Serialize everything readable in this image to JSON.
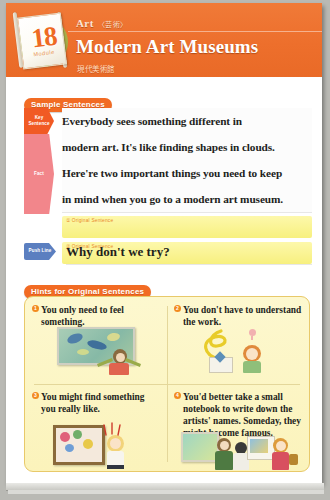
{
  "header": {
    "unit_number": "18",
    "unit_word": "Module",
    "kicker": "Art",
    "kicker_jp": "〈芸術〉",
    "title": "Modern Art Museums",
    "title_jp": "現代美術館",
    "accent_color": "#ef7633",
    "badge_disc_color": "#a8b84e"
  },
  "sample_section": {
    "tag": "Sample Sentences",
    "marks": {
      "key": "Key Sentence",
      "fact": "Fact",
      "push": "Push Line"
    },
    "lines": [
      "Everybody sees something different in",
      "modern art. It's like finding shapes in clouds.",
      "Here're two important things you need to keep",
      "in mind when you go to a modern art museum."
    ],
    "answer_boxes": [
      {
        "label": "① Original Sentence",
        "value": ""
      },
      {
        "label": "② Original Sentence",
        "value": ""
      }
    ],
    "push_line_text": "Why don't we try?"
  },
  "hints_section": {
    "tag": "Hints for Original Sentences",
    "items": [
      {
        "number": "①",
        "text": "You only need to feel something.",
        "illustration": "person-viewing-abstract-painting"
      },
      {
        "number": "②",
        "text": "You don't have to understand the work.",
        "illustration": "person-confused-at-sculpture"
      },
      {
        "number": "③",
        "text": "You might find something you really like.",
        "illustration": "girl-admiring-framed-artwork"
      },
      {
        "number": "④",
        "text": "You'd better take a small notebook to write down the artists' names. Someday, they might become famous.",
        "illustration": "visitors-taking-notes-in-gallery"
      }
    ],
    "box_color": "#fdf6c6",
    "border_color": "#e8c96a"
  }
}
